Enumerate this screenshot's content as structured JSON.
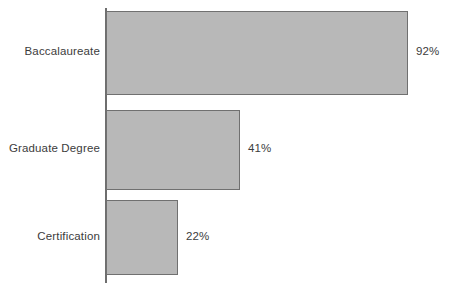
{
  "chart_data": {
    "type": "bar",
    "orientation": "horizontal",
    "title": "",
    "subtitle": "",
    "xlabel": "",
    "ylabel": "",
    "categories": [
      "Baccalaureate",
      "Graduate Degree",
      "Certification"
    ],
    "values": [
      92,
      41,
      22
    ],
    "value_labels": [
      "92%",
      "41%",
      "22%"
    ],
    "xlim": [
      0,
      100
    ],
    "grid": false,
    "legend": false,
    "legend_position": "none",
    "value_label_position": "outside-end",
    "colors": {
      "bar_fill": "#b8b8b8",
      "bar_border": "#707070",
      "axis_line": "#6e6e6e",
      "text": "#3c3c3c",
      "background": "#ffffff"
    }
  },
  "geometry": {
    "axis_x": 106,
    "px_per_percent": 3.28,
    "bars": [
      {
        "top": 11,
        "height": 84
      },
      {
        "top": 110,
        "height": 80
      },
      {
        "top": 200,
        "height": 75
      }
    ]
  }
}
